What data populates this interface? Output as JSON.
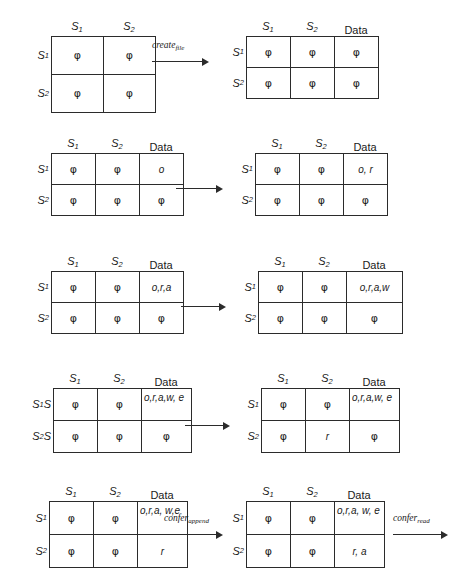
{
  "figure": {
    "phi_symbol": "φ",
    "line_color": "#2b2b2b",
    "background": "#ffffff",
    "rows": [
      {
        "id": "row-1",
        "left": {
          "col_headers": [
            "S",
            "S"
          ],
          "col_header_subs": [
            "1",
            "2"
          ],
          "row_headers": [
            "S",
            "S"
          ],
          "row_header_subs": [
            "1",
            "2"
          ],
          "cells": [
            [
              "φ",
              "φ"
            ],
            [
              "φ",
              "φ"
            ]
          ]
        },
        "arrow": {
          "label": "create",
          "sub": "file"
        },
        "right": {
          "col_headers": [
            "S",
            "S",
            "Data"
          ],
          "col_header_subs": [
            "1",
            "2",
            ""
          ],
          "row_headers": [
            "S",
            "S"
          ],
          "row_header_subs": [
            "1",
            "2"
          ],
          "cells": [
            [
              "φ",
              "φ",
              "φ"
            ],
            [
              "φ",
              "φ",
              "φ"
            ]
          ]
        }
      },
      {
        "id": "row-2",
        "left": {
          "col_headers": [
            "S",
            "S",
            "Data"
          ],
          "col_header_subs": [
            "1",
            "2",
            ""
          ],
          "row_headers": [
            "S",
            "S"
          ],
          "row_header_subs": [
            "1",
            "2"
          ],
          "cells": [
            [
              "φ",
              "φ",
              "o"
            ],
            [
              "φ",
              "φ",
              "φ"
            ]
          ]
        },
        "arrow": {
          "label": "",
          "sub": ""
        },
        "right": {
          "col_headers": [
            "S",
            "S",
            "Data"
          ],
          "col_header_subs": [
            "1",
            "2",
            ""
          ],
          "row_headers": [
            "S",
            "S"
          ],
          "row_header_subs": [
            "1",
            "2"
          ],
          "cells": [
            [
              "φ",
              "φ",
              "o, r"
            ],
            [
              "φ",
              "φ",
              "φ"
            ]
          ]
        }
      },
      {
        "id": "row-3",
        "left": {
          "col_headers": [
            "S",
            "S",
            "Data"
          ],
          "col_header_subs": [
            "1",
            "2",
            ""
          ],
          "row_headers": [
            "S",
            "S"
          ],
          "row_header_subs": [
            "1",
            "2"
          ],
          "cells": [
            [
              "φ",
              "φ",
              "o,r,a"
            ],
            [
              "φ",
              "φ",
              "φ"
            ]
          ]
        },
        "arrow": {
          "label": "",
          "sub": ""
        },
        "right": {
          "col_headers": [
            "S",
            "S",
            "Data"
          ],
          "col_header_subs": [
            "1",
            "2",
            ""
          ],
          "row_headers": [
            "S",
            "S"
          ],
          "row_header_subs": [
            "1",
            "2"
          ],
          "cells": [
            [
              "φ",
              "φ",
              "o,r,a,w"
            ],
            [
              "φ",
              "φ",
              "φ"
            ]
          ]
        }
      },
      {
        "id": "row-4",
        "left": {
          "col_headers": [
            "S",
            "S",
            "Data"
          ],
          "col_header_subs": [
            "1",
            "2",
            ""
          ],
          "row_headers": [
            "S",
            "S"
          ],
          "row_header_subs": [
            "1",
            "2"
          ],
          "row_header_suffix": [
            "S",
            "S"
          ],
          "cells": [
            [
              "φ",
              "φ",
              "o,r,a,w, e"
            ],
            [
              "φ",
              "φ",
              "φ"
            ]
          ]
        },
        "arrow": {
          "label": "",
          "sub": ""
        },
        "right": {
          "col_headers": [
            "S",
            "S",
            "Data"
          ],
          "col_header_subs": [
            "1",
            "2",
            ""
          ],
          "row_headers": [
            "S",
            "S"
          ],
          "row_header_subs": [
            "1",
            "2"
          ],
          "cells": [
            [
              "φ",
              "φ",
              "o,r,a,w, e"
            ],
            [
              "φ",
              "r",
              "φ"
            ]
          ]
        }
      },
      {
        "id": "row-5",
        "left": {
          "col_headers": [
            "S",
            "S",
            "Data"
          ],
          "col_header_subs": [
            "1",
            "2",
            ""
          ],
          "row_headers": [
            "S",
            "S"
          ],
          "row_header_subs": [
            "1",
            "2"
          ],
          "cells": [
            [
              "φ",
              "φ",
              "o,r,a, w,e"
            ],
            [
              "φ",
              "φ",
              "r"
            ]
          ]
        },
        "arrow": {
          "label": "confer",
          "sub": "append"
        },
        "right": {
          "col_headers": [
            "S",
            "S",
            "Data"
          ],
          "col_header_subs": [
            "1",
            "2",
            ""
          ],
          "row_headers": [
            "S",
            "S"
          ],
          "row_header_subs": [
            "1",
            "2"
          ],
          "cells": [
            [
              "φ",
              "φ",
              "o,r,a, w, e"
            ],
            [
              "φ",
              "φ",
              "r, a"
            ]
          ]
        },
        "trailing_arrow": {
          "label": "confer",
          "sub": "read"
        }
      }
    ]
  }
}
